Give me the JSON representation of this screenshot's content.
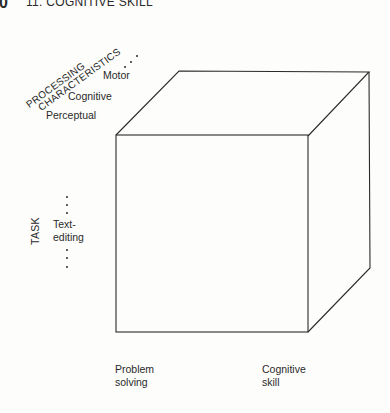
{
  "header": {
    "page_number": "0",
    "chapter": "11. COGNITIVE SKILL"
  },
  "axes": {
    "processing": {
      "title_line1": "PROCESSING",
      "title_line2": "CHARACTERISTICS",
      "items": [
        "Motor",
        "Cognitive",
        "Perceptual"
      ],
      "continuation": "..."
    },
    "task": {
      "title": "TASK",
      "item_line1": "Text-",
      "item_line2": "editing",
      "continuation": "..."
    },
    "bottom": [
      {
        "line1": "Problem",
        "line2": "solving"
      },
      {
        "line1": "Cognitive",
        "line2": "skill"
      }
    ]
  },
  "cube": {
    "front": {
      "x1": 116,
      "y1": 135,
      "x2": 308,
      "y2": 332
    },
    "back_top_left": [
      179,
      71
    ],
    "back_top_right": [
      369,
      72
    ],
    "back_bottom_right": [
      370,
      268
    ],
    "stroke": "#2a2a2a"
  }
}
